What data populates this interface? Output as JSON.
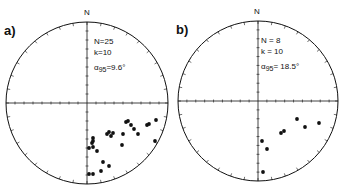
{
  "panels": [
    {
      "id": "a",
      "label": "a)",
      "north": "N",
      "stats": {
        "n": "N=25",
        "k": "k=10",
        "alpha": "α95 =9.6°",
        "alpha_sym": "α",
        "alpha_sub": "95",
        "alpha_val": "=9.6°"
      },
      "center": [
        87,
        103
      ],
      "radius": 81,
      "points": [
        [
          93,
          138
        ],
        [
          93,
          141
        ],
        [
          92,
          143
        ],
        [
          89,
          148
        ],
        [
          93,
          147
        ],
        [
          97,
          151
        ],
        [
          107,
          134
        ],
        [
          109,
          132
        ],
        [
          111,
          136
        ],
        [
          113,
          133
        ],
        [
          123,
          134
        ],
        [
          122,
          145
        ],
        [
          126,
          122
        ],
        [
          128,
          121
        ],
        [
          131,
          125
        ],
        [
          134,
          129
        ],
        [
          138,
          134
        ],
        [
          147,
          125
        ],
        [
          149,
          124
        ],
        [
          156,
          120
        ],
        [
          155,
          141
        ],
        [
          103,
          162
        ],
        [
          109,
          166
        ],
        [
          101,
          171
        ],
        [
          89,
          174
        ],
        [
          93,
          174
        ]
      ]
    },
    {
      "id": "b",
      "label": "b)",
      "north": "N",
      "stats": {
        "n": "N = 8",
        "k": "k = 10",
        "alpha": "α95 = 18.5°",
        "alpha_sym": "α",
        "alpha_sub": "95",
        "alpha_val": "= 18.5°"
      },
      "center": [
        258,
        101
      ],
      "radius": 80,
      "points": [
        [
          297,
          119
        ],
        [
          305,
          127
        ],
        [
          319,
          123
        ],
        [
          281,
          133
        ],
        [
          284,
          131
        ],
        [
          262,
          141
        ],
        [
          267,
          149
        ],
        [
          263,
          172
        ]
      ]
    }
  ],
  "colors": {
    "ink": "#111111",
    "background": "#ffffff"
  }
}
